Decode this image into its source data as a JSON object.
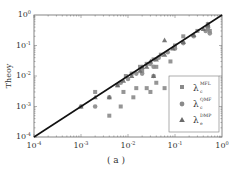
{
  "chart_data": {
    "type": "scatter",
    "title": "",
    "xlabel": "",
    "ylabel": "Theoy",
    "caption": "( a )",
    "xscale": "log",
    "yscale": "log",
    "xlim": [
      0.0001,
      1
    ],
    "ylim": [
      0.0001,
      1
    ],
    "x_ticks": [
      "10^-4",
      "10^-3",
      "10^-2",
      "10^-1",
      "10^0"
    ],
    "y_ticks": [
      "10^-4",
      "10^-3",
      "10^-2",
      "10^-1",
      "10^0"
    ],
    "grid": false,
    "legend_position": "lower right",
    "reference_line": {
      "type": "y=x",
      "color": "#111111"
    },
    "series": [
      {
        "name": "λc MFL",
        "label_main": "λ",
        "label_sub": "c",
        "label_sup": "MFL",
        "marker": "square",
        "color": "#8a8a8a",
        "points": [
          [
            0.002,
            0.003
          ],
          [
            0.004,
            0.0005
          ],
          [
            0.007,
            0.001
          ],
          [
            0.008,
            0.003
          ],
          [
            0.013,
            0.002
          ],
          [
            0.015,
            0.004
          ],
          [
            0.025,
            0.004
          ],
          [
            0.03,
            0.003
          ],
          [
            0.04,
            0.006
          ],
          [
            0.06,
            0.004
          ],
          [
            0.08,
            0.03
          ],
          [
            0.006,
            0.005
          ],
          [
            0.009,
            0.01
          ],
          [
            0.012,
            0.012
          ],
          [
            0.018,
            0.02
          ],
          [
            0.025,
            0.025
          ],
          [
            0.035,
            0.035
          ],
          [
            0.05,
            0.05
          ],
          [
            0.1,
            0.1
          ],
          [
            0.15,
            0.2
          ],
          [
            0.3,
            0.3
          ],
          [
            0.5,
            0.5
          ],
          [
            0.55,
            0.3
          ],
          [
            0.02,
            0.015
          ],
          [
            0.04,
            0.02
          ]
        ]
      },
      {
        "name": "λc QMF",
        "label_main": "λ",
        "label_sub": "c",
        "label_sup": "QMF",
        "marker": "circle",
        "color": "#8a8a8a",
        "points": [
          [
            0.001,
            0.001
          ],
          [
            0.002,
            0.001
          ],
          [
            0.004,
            0.002
          ],
          [
            0.035,
            0.01
          ],
          [
            0.007,
            0.006
          ],
          [
            0.01,
            0.008
          ],
          [
            0.015,
            0.012
          ],
          [
            0.02,
            0.018
          ],
          [
            0.03,
            0.025
          ],
          [
            0.045,
            0.04
          ],
          [
            0.07,
            0.06
          ],
          [
            0.1,
            0.08
          ],
          [
            0.15,
            0.12
          ],
          [
            0.25,
            0.2
          ],
          [
            0.45,
            0.3
          ],
          [
            0.5,
            0.35
          ],
          [
            0.55,
            0.25
          ],
          [
            0.5,
            0.4
          ],
          [
            0.02,
            0.012
          ],
          [
            0.035,
            0.02
          ]
        ]
      },
      {
        "name": "λe DMP",
        "label_main": "λ",
        "label_sub": "e",
        "label_sup": "DMP",
        "marker": "triangle",
        "color": "#6a6a6a",
        "points": [
          [
            0.001,
            0.001
          ],
          [
            0.002,
            0.002
          ],
          [
            0.004,
            0.002
          ],
          [
            0.035,
            0.01
          ],
          [
            0.06,
            0.15
          ],
          [
            0.006,
            0.005
          ],
          [
            0.008,
            0.007
          ],
          [
            0.012,
            0.01
          ],
          [
            0.018,
            0.015
          ],
          [
            0.025,
            0.02
          ],
          [
            0.04,
            0.035
          ],
          [
            0.06,
            0.05
          ],
          [
            0.09,
            0.08
          ],
          [
            0.15,
            0.13
          ],
          [
            0.25,
            0.22
          ],
          [
            0.4,
            0.35
          ],
          [
            0.5,
            0.45
          ],
          [
            0.5,
            0.5
          ],
          [
            0.02,
            0.02
          ],
          [
            0.03,
            0.03
          ]
        ]
      }
    ]
  },
  "labels": {
    "ylabel": "Theoy",
    "caption": "( a )",
    "x_ticks": [
      {
        "base": "10",
        "exp": "-4"
      },
      {
        "base": "10",
        "exp": "-3"
      },
      {
        "base": "10",
        "exp": "-2"
      },
      {
        "base": "10",
        "exp": "-1"
      },
      {
        "base": "10",
        "exp": "0"
      }
    ],
    "y_ticks": [
      {
        "base": "10",
        "exp": "-4"
      },
      {
        "base": "10",
        "exp": "-3"
      },
      {
        "base": "10",
        "exp": "-2"
      },
      {
        "base": "10",
        "exp": "-1"
      },
      {
        "base": "10",
        "exp": "0"
      }
    ],
    "legend": [
      {
        "main": "λ",
        "sub": "c",
        "sup": "MFL"
      },
      {
        "main": "λ",
        "sub": "c",
        "sup": "QMF"
      },
      {
        "main": "λ",
        "sub": "e",
        "sup": "DMP"
      }
    ]
  }
}
